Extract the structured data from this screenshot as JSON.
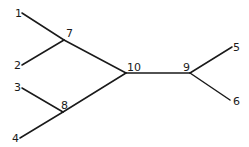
{
  "diagram": {
    "type": "tree",
    "nodes": [
      {
        "id": "1",
        "label": "1",
        "x": 22,
        "y": 13,
        "lx": 15,
        "ly": 17,
        "kind": "leaf"
      },
      {
        "id": "2",
        "label": "2",
        "x": 22,
        "y": 65,
        "lx": 14,
        "ly": 69,
        "kind": "leaf"
      },
      {
        "id": "3",
        "label": "3",
        "x": 22,
        "y": 88,
        "lx": 14,
        "ly": 91,
        "kind": "leaf"
      },
      {
        "id": "4",
        "label": "4",
        "x": 20,
        "y": 138,
        "lx": 12,
        "ly": 142,
        "kind": "leaf"
      },
      {
        "id": "5",
        "label": "5",
        "x": 232,
        "y": 47,
        "lx": 233,
        "ly": 51,
        "kind": "leaf"
      },
      {
        "id": "6",
        "label": "6",
        "x": 230,
        "y": 100,
        "lx": 233,
        "ly": 105,
        "kind": "leaf"
      },
      {
        "id": "7",
        "label": "7",
        "x": 64,
        "y": 40,
        "lx": 66,
        "ly": 37,
        "kind": "internal"
      },
      {
        "id": "8",
        "label": "8",
        "x": 63,
        "y": 112,
        "lx": 61,
        "ly": 109,
        "kind": "internal"
      },
      {
        "id": "9",
        "label": "9",
        "x": 190,
        "y": 73,
        "lx": 183,
        "ly": 71,
        "kind": "internal"
      },
      {
        "id": "10",
        "label": "10",
        "x": 126,
        "y": 73,
        "lx": 127,
        "ly": 71,
        "kind": "internal"
      }
    ],
    "edges": [
      [
        "1",
        "7"
      ],
      [
        "2",
        "7"
      ],
      [
        "7",
        "10"
      ],
      [
        "3",
        "8"
      ],
      [
        "4",
        "8"
      ],
      [
        "8",
        "10"
      ],
      [
        "10",
        "9"
      ],
      [
        "9",
        "5"
      ],
      [
        "9",
        "6"
      ]
    ],
    "colors": {
      "line": "#1a1a1a",
      "text": "#1a1a1a",
      "background": "#ffffff"
    }
  }
}
